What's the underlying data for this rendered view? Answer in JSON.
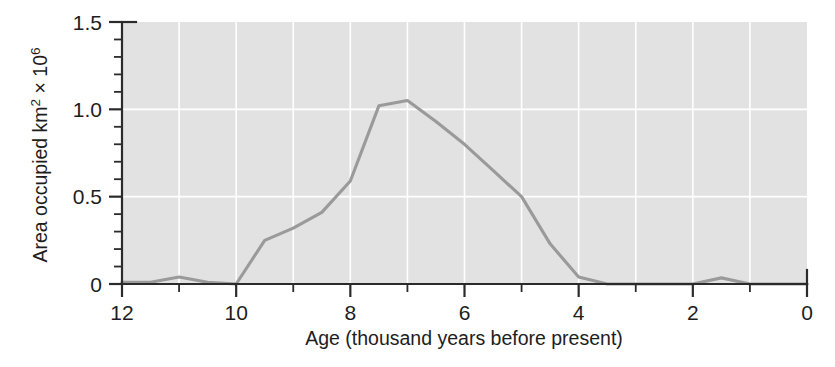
{
  "chart_data": {
    "type": "line",
    "title": "",
    "xlabel": "Age (thousand years before present)",
    "ylabel": "Area occupied km2 × 106",
    "ylabel_parts": {
      "lead": "Area occupied km",
      "sup1": "2",
      "mid": " × 10",
      "sup2": "6"
    },
    "xlim": [
      12,
      0
    ],
    "ylim": [
      0,
      1.5
    ],
    "x_reversed": true,
    "grid": true,
    "grid_color": "#ffffff",
    "plot_background": "#e2e2e2",
    "line_color": "#9a9a9a",
    "axis_color": "#2b2b2b",
    "legend": null,
    "x_major_ticks": [
      12,
      10,
      8,
      6,
      4,
      2,
      0
    ],
    "x_minor_ticks": [
      11,
      9,
      7,
      5,
      3,
      1
    ],
    "x_tick_labels": [
      "12",
      "10",
      "8",
      "6",
      "4",
      "2",
      "0"
    ],
    "y_major_ticks": [
      0,
      0.5,
      1.0,
      1.5
    ],
    "y_minor_ticks": [
      0.1,
      0.2,
      0.3,
      0.4,
      0.6,
      0.7,
      0.8,
      0.9,
      1.1,
      1.2,
      1.3,
      1.4
    ],
    "y_tick_labels": [
      "0",
      "0.5",
      "1.0",
      "1.5"
    ],
    "x": [
      12.0,
      11.5,
      11.0,
      10.5,
      10.0,
      9.5,
      9.0,
      8.5,
      8.0,
      7.5,
      7.0,
      6.5,
      6.0,
      5.5,
      5.0,
      4.5,
      4.0,
      3.5,
      3.0,
      2.5,
      2.0,
      1.5,
      1.0,
      0.5,
      0.0
    ],
    "values": [
      0.01,
      0.01,
      0.04,
      0.01,
      0.0,
      0.25,
      0.32,
      0.41,
      0.59,
      1.02,
      1.05,
      0.93,
      0.8,
      0.65,
      0.5,
      0.23,
      0.04,
      0.0,
      0.0,
      0.0,
      0.0,
      0.035,
      0.0,
      0.0,
      0.0
    ],
    "series": [
      {
        "name": "Area occupied",
        "values": [
          0.01,
          0.01,
          0.04,
          0.01,
          0.0,
          0.25,
          0.32,
          0.41,
          0.59,
          1.02,
          1.05,
          0.93,
          0.8,
          0.65,
          0.5,
          0.23,
          0.04,
          0.0,
          0.0,
          0.0,
          0.0,
          0.035,
          0.0,
          0.0,
          0.0
        ]
      }
    ],
    "annotations": []
  }
}
